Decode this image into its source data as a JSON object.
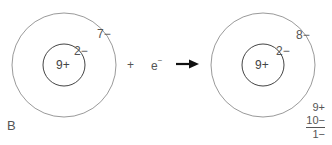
{
  "diagram": {
    "panel_label": "B",
    "left_atom": {
      "nucleus": "9+",
      "inner_shell": "2−",
      "outer_shell": "7−"
    },
    "plus_sign": "+",
    "electron": "e",
    "electron_charge": "−",
    "arrow": "right-arrow",
    "right_atom": {
      "nucleus": "9+",
      "inner_shell": "2−",
      "outer_shell": "8−"
    },
    "charge_sum": {
      "protons": "9+",
      "electrons": "10−",
      "net": "1−"
    },
    "colors": {
      "outer_shell": "#9a9a9a",
      "inner_shell": "#444444",
      "arrow": "#111111",
      "text": "#555555"
    }
  }
}
